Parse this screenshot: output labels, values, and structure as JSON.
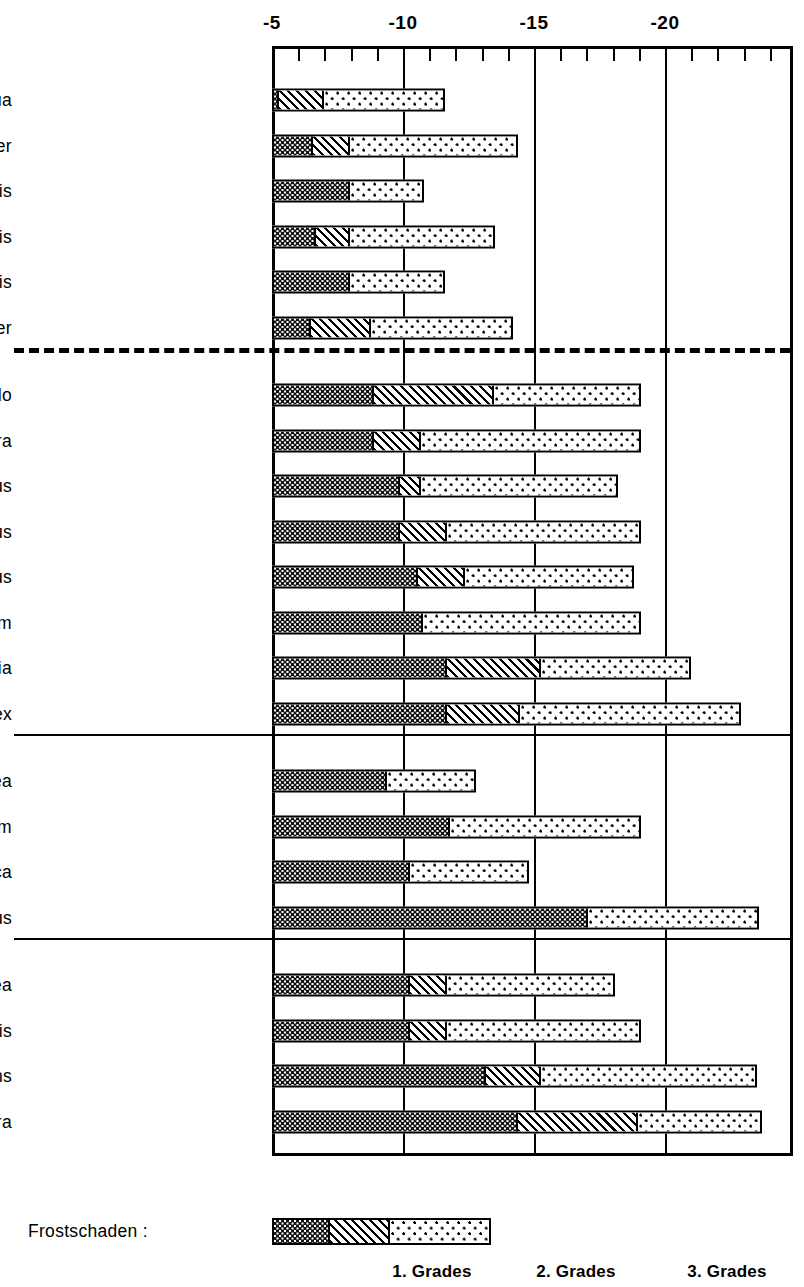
{
  "chart_data": {
    "type": "bar",
    "orientation": "horizontal",
    "style": "stacked",
    "title": "",
    "xlabel": "",
    "ylabel": "",
    "xlim": [
      -5,
      -20.4
    ],
    "x_tick_labels": [
      "-5",
      "-10",
      "-15",
      "-20"
    ],
    "x_tick_values": [
      -5,
      -10,
      -15,
      -20
    ],
    "x_minor_tick_step": 1,
    "grid": true,
    "legend_position": "bottom",
    "legend_title": "Frostschaden :",
    "series": [
      {
        "name": "1. Grades",
        "pattern": "dark-checker"
      },
      {
        "name": "2. Grades",
        "pattern": "diagonal-hatch"
      },
      {
        "name": "3. Grades",
        "pattern": "sparse-dots"
      }
    ],
    "groups": [
      {
        "separator_after": "dashed",
        "rows": [
          {
            "label": "Ceratonia  siliqua",
            "start": -5.0,
            "g1_end": -5.2,
            "g2_end": -6.9,
            "g3_end": -11.6
          },
          {
            "label": "Nerium  oleander",
            "start": -5.0,
            "g1_end": -6.5,
            "g2_end": -7.9,
            "g3_end": -14.4
          },
          {
            "label": "Laurus  nobilis",
            "start": -5.0,
            "g1_end": -7.9,
            "g2_end": -7.9,
            "g3_end": -10.8
          },
          {
            "label": "Myrtus  communis",
            "start": -5.0,
            "g1_end": -6.6,
            "g2_end": -7.9,
            "g3_end": -13.5
          },
          {
            "label": "Rosmarinus  officinalis",
            "start": -5.0,
            "g1_end": -7.9,
            "g2_end": -7.9,
            "g3_end": -11.6
          },
          {
            "label": "Quercus  suber",
            "start": -5.0,
            "g1_end": -6.4,
            "g2_end": -8.7,
            "g3_end": -14.2
          }
        ]
      },
      {
        "separator_after": "solid",
        "rows": [
          {
            "label": "Arbutus  unedo",
            "start": -5.0,
            "g1_end": -8.8,
            "g2_end": -13.4,
            "g3_end": -19.1
          },
          {
            "label": "Quercus  coccifera",
            "start": -5.0,
            "g1_end": -8.8,
            "g2_end": -10.6,
            "g3_end": -19.1
          },
          {
            "label": "Rhamnus  alaternus",
            "start": -5.0,
            "g1_end": -9.8,
            "g2_end": -10.6,
            "g3_end": -18.2
          },
          {
            "label": "Viburnum  tinus",
            "start": -5.0,
            "g1_end": -9.8,
            "g2_end": -11.6,
            "g3_end": -19.1
          },
          {
            "label": "Pistacia  lentiscus",
            "start": -5.0,
            "g1_end": -10.5,
            "g2_end": -12.3,
            "g3_end": -18.8
          },
          {
            "label": "Spartium  junceum",
            "start": -5.0,
            "g1_end": -10.7,
            "g2_end": -10.7,
            "g3_end": -19.1
          },
          {
            "label": "Phillyrea  latifolia",
            "start": -5.0,
            "g1_end": -11.6,
            "g2_end": -15.2,
            "g3_end": -21.0
          },
          {
            "label": "Quercus  ilex",
            "start": -5.0,
            "g1_end": -11.6,
            "g2_end": -14.4,
            "g3_end": -22.9
          }
        ]
      },
      {
        "separator_after": "solid",
        "rows": [
          {
            "label": "Olea  europaea",
            "start": -5.0,
            "g1_end": -9.3,
            "g2_end": -9.3,
            "g3_end": -12.8
          },
          {
            "label": "Punica  granatum",
            "start": -5.0,
            "g1_end": -11.7,
            "g2_end": -11.7,
            "g3_end": -19.1
          },
          {
            "label": "Ficus  carica",
            "start": -5.0,
            "g1_end": -10.2,
            "g2_end": -10.2,
            "g3_end": -14.8
          },
          {
            "label": "Prunus  amygdalus",
            "start": -5.0,
            "g1_end": -17.0,
            "g2_end": -17.0,
            "g3_end": -23.6
          }
        ]
      },
      {
        "separator_after": "none",
        "rows": [
          {
            "label": "Pinus  pinea",
            "start": -5.0,
            "g1_end": -10.2,
            "g2_end": -11.6,
            "g3_end": -18.1
          },
          {
            "label": "Pinus  halepensis",
            "start": -5.0,
            "g1_end": -10.2,
            "g2_end": -11.6,
            "g3_end": -19.1
          },
          {
            "label": "Cupressus  sempervirens",
            "start": -5.0,
            "g1_end": -13.1,
            "g2_end": -15.2,
            "g3_end": -23.5
          },
          {
            "label": "Cedrus  deodara",
            "start": -5.0,
            "g1_end": -14.3,
            "g2_end": -18.9,
            "g3_end": -23.7
          }
        ]
      }
    ],
    "legend_captions": [
      "1. Grades",
      "2. Grades",
      "3. Grades"
    ]
  }
}
